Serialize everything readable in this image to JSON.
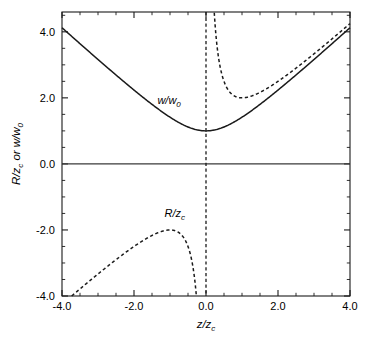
{
  "chart_data": {
    "type": "line",
    "title": "",
    "xlabel": "z/z_c",
    "ylabel": "R/z_c or w/w_0",
    "xlim": [
      -4.0,
      4.0
    ],
    "ylim": [
      -4.0,
      4.6
    ],
    "grid": false,
    "legend": "inline-annotations",
    "x_ticks": [
      -4.0,
      -2.0,
      0.0,
      2.0,
      4.0
    ],
    "x_tick_labels": [
      "-4.0",
      "-2.0",
      "0.0",
      "2.0",
      "4.0"
    ],
    "y_ticks": [
      -4.0,
      -2.0,
      0.0,
      2.0,
      4.0
    ],
    "y_tick_labels": [
      "-4.0",
      "-2.0",
      "0.0",
      "2.0",
      "4.0"
    ],
    "x_minor_step": 0.5,
    "y_minor_step": 0.5,
    "series": [
      {
        "name": "w/w_0",
        "style": "solid",
        "formula": "sqrt(1 + (z/z_c)^2)",
        "x": [
          -4.0,
          -3.5,
          -3.0,
          -2.5,
          -2.0,
          -1.5,
          -1.0,
          -0.5,
          0.0,
          0.5,
          1.0,
          1.5,
          2.0,
          2.5,
          3.0,
          3.5,
          4.0
        ],
        "values": [
          4.123,
          3.64,
          3.162,
          2.693,
          2.236,
          1.803,
          1.414,
          1.118,
          1.0,
          1.118,
          1.414,
          1.803,
          2.236,
          2.693,
          3.162,
          3.64,
          4.123
        ]
      },
      {
        "name": "R/z_c",
        "style": "dashed",
        "formula": "(z/z_c) + (z_c/z)",
        "x_negative_branch": [
          -3.732,
          -3.5,
          -3.0,
          -2.5,
          -2.0,
          -1.5,
          -1.0,
          -0.75,
          -0.5,
          -0.4,
          -0.3,
          -0.27
        ],
        "values_negative_branch": [
          -4.0,
          -3.786,
          -3.333,
          -2.9,
          -2.5,
          -2.167,
          -2.0,
          -2.083,
          -2.5,
          -2.9,
          -3.633,
          -3.974
        ],
        "x_positive_branch": [
          0.27,
          0.3,
          0.4,
          0.5,
          0.75,
          1.0,
          1.5,
          2.0,
          2.5,
          3.0,
          3.5,
          4.0
        ],
        "values_positive_branch": [
          3.974,
          3.633,
          2.9,
          2.5,
          2.083,
          2.0,
          2.167,
          2.5,
          2.9,
          3.333,
          3.786,
          4.25
        ],
        "minimum_positive": {
          "x": 1.0,
          "y": 2.0
        },
        "maximum_negative": {
          "x": -1.0,
          "y": -2.0
        },
        "asymptote_x": 0.0
      }
    ],
    "annotations": [
      {
        "text": "w/w_0",
        "x": -1.35,
        "y": 1.82,
        "name": "w-over-w0-label"
      },
      {
        "text": "R/z_c",
        "x": -1.15,
        "y": -1.62,
        "name": "r-over-zc-label"
      }
    ],
    "reference_lines": [
      {
        "orientation": "horizontal",
        "value": 0.0,
        "style": "solid",
        "name": "zero-line"
      },
      {
        "orientation": "vertical",
        "value": 0.0,
        "style": "dashed",
        "name": "asymptote-line"
      }
    ]
  },
  "axis": {
    "x_title_main": "z/z",
    "x_title_sub": "c",
    "y_title_part1": "R/z",
    "y_title_sub1": "c",
    "y_title_part2": " or w/w",
    "y_title_sub2": "0"
  },
  "labels": {
    "w_label_main": "w/w",
    "w_label_sub": "0",
    "r_label_main": "R/z",
    "r_label_sub": "c"
  },
  "ticks": {
    "x": [
      "-4.0",
      "-2.0",
      "0.0",
      "2.0",
      "4.0"
    ],
    "y": [
      "4.0",
      "2.0",
      "0.0",
      "-2.0",
      "-4.0"
    ]
  },
  "colors": {
    "ink": "#1a1a1a",
    "background": "#ffffff",
    "zero_line": "#3a3a3a"
  }
}
